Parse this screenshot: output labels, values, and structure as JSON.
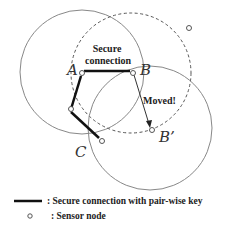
{
  "diagram": {
    "nodes": [
      {
        "id": "A",
        "label": "A",
        "x": 82,
        "y": 73
      },
      {
        "id": "B",
        "label": "B",
        "x": 133,
        "y": 73
      },
      {
        "id": "M",
        "label": "",
        "x": 71,
        "y": 110
      },
      {
        "id": "C",
        "label": "C",
        "x": 102,
        "y": 141
      },
      {
        "id": "Bp",
        "label": "B’",
        "x": 152,
        "y": 131
      },
      {
        "id": "X",
        "label": "",
        "x": 189,
        "y": 28
      }
    ],
    "annotations": {
      "secure_line1": "Secure",
      "secure_line2": "connection",
      "moved": "Moved!"
    },
    "labels": {
      "A": "A",
      "B": "B",
      "Bp": "B’",
      "C": "C"
    }
  },
  "legend": {
    "secure_connection": ": Secure connection with pair-wise key",
    "sensor_node": ": Sensor node"
  },
  "colors": {
    "line": "#111111",
    "circle": "#777777"
  }
}
